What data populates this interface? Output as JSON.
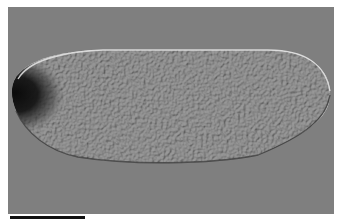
{
  "image": {
    "description": "DIC micrograph of an elongated embryo with a dark anterior pole on the left",
    "colors": {
      "background": "#7f7f7f",
      "embryo": "#9a9a9a",
      "pole": "#121212",
      "highlight": "#e6e6e6",
      "shadow": "#3a3a3a",
      "scale_bar": "#111111"
    }
  },
  "scale_bar": {
    "label": ""
  }
}
